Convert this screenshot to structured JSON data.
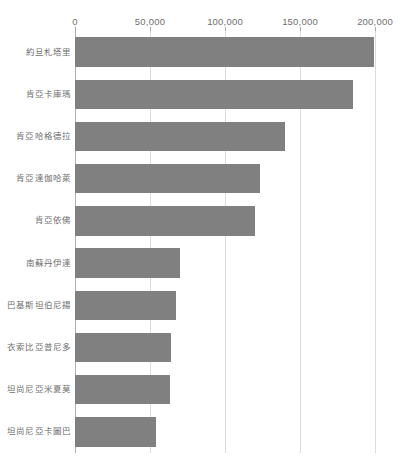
{
  "chart_data": {
    "type": "bar",
    "orientation": "horizontal",
    "title": "",
    "subtitle": "",
    "xlabel": "",
    "ylabel": "",
    "xlim": [
      0,
      200000
    ],
    "grid": true,
    "legend": false,
    "legend_position": "none",
    "axis_position": "top",
    "bar_color": "#808080",
    "gridline_color": "#dcdcdc",
    "text_color": "#6f6f6f",
    "x_ticks": [
      0,
      50000,
      100000,
      150000,
      200000
    ],
    "x_tick_labels": [
      "0",
      "50,000",
      "100,000",
      "150,000",
      "200,000"
    ],
    "categories": [
      "約旦札塔里",
      "肯亞卡庫瑪",
      "肯亞哈格德拉",
      "肯亞達伽哈萊",
      "肯亞依佛",
      "南蘇丹伊達",
      "巴基斯坦伯尼揚",
      "衣索比亞普尼多",
      "坦尚尼亞米夏莫",
      "坦尚尼亞卡圖巴"
    ],
    "values": [
      199000,
      185000,
      140000,
      123000,
      120000,
      70000,
      67000,
      64000,
      63000,
      54000
    ]
  }
}
